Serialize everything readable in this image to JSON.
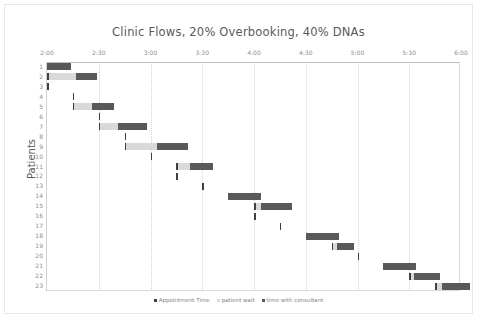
{
  "chart_data": {
    "type": "bar",
    "title": "Clinic Flows, 20% Overbooking, 40% DNAs",
    "xlabel": "",
    "ylabel": "Patients",
    "xlim": [
      "2:00",
      "6:00"
    ],
    "x_ticks": [
      "2:00",
      "2:30",
      "3:00",
      "3:30",
      "4:00",
      "4:30",
      "5:00",
      "5:30",
      "6:00"
    ],
    "x_tick_minutes": [
      0,
      30,
      60,
      90,
      120,
      150,
      180,
      210,
      240
    ],
    "axis_position": "top",
    "grid": true,
    "legend_position": "bottom",
    "orientation": "horizontal-gantt",
    "categories": [
      "1",
      "2",
      "3",
      "4",
      "5",
      "6",
      "7",
      "8",
      "9",
      "10",
      "11",
      "12",
      "13",
      "14",
      "15",
      "16",
      "17",
      "18",
      "19",
      "20",
      "21",
      "22",
      "23"
    ],
    "series": [
      {
        "name": "Appointment Time",
        "color": "#404040",
        "type": "marker"
      },
      {
        "name": "patient wait",
        "color": "#d9d9d9",
        "type": "duration"
      },
      {
        "name": "time with consultant",
        "color": "#595959",
        "type": "duration"
      }
    ],
    "units": "minutes after 2:00",
    "rows": [
      {
        "patient": "1",
        "appointment": 0,
        "wait": 0,
        "consult": 14
      },
      {
        "patient": "2",
        "appointment": 0,
        "wait": 17,
        "consult": 12
      },
      {
        "patient": "3",
        "appointment": 0,
        "wait": 0,
        "consult": 0
      },
      {
        "patient": "4",
        "appointment": 15,
        "wait": 0,
        "consult": 0
      },
      {
        "patient": "5",
        "appointment": 15,
        "wait": 11,
        "consult": 13
      },
      {
        "patient": "6",
        "appointment": 30,
        "wait": 0,
        "consult": 0
      },
      {
        "patient": "7",
        "appointment": 30,
        "wait": 11,
        "consult": 17
      },
      {
        "patient": "8",
        "appointment": 45,
        "wait": 0,
        "consult": 0
      },
      {
        "patient": "9",
        "appointment": 45,
        "wait": 19,
        "consult": 18
      },
      {
        "patient": "10",
        "appointment": 60,
        "wait": 0,
        "consult": 0
      },
      {
        "patient": "11",
        "appointment": 75,
        "wait": 8,
        "consult": 13
      },
      {
        "patient": "12",
        "appointment": 75,
        "wait": 0,
        "consult": 0
      },
      {
        "patient": "13",
        "appointment": 90,
        "wait": 0,
        "consult": 0
      },
      {
        "patient": "14",
        "appointment": 105,
        "wait": 0,
        "consult": 19
      },
      {
        "patient": "15",
        "appointment": 120,
        "wait": 4,
        "consult": 18
      },
      {
        "patient": "16",
        "appointment": 120,
        "wait": 0,
        "consult": 0
      },
      {
        "patient": "17",
        "appointment": 135,
        "wait": 0,
        "consult": 0
      },
      {
        "patient": "18",
        "appointment": 150,
        "wait": 0,
        "consult": 19
      },
      {
        "patient": "19",
        "appointment": 165,
        "wait": 3,
        "consult": 10
      },
      {
        "patient": "20",
        "appointment": 180,
        "wait": 0,
        "consult": 0
      },
      {
        "patient": "21",
        "appointment": 195,
        "wait": 0,
        "consult": 19
      },
      {
        "patient": "22",
        "appointment": 210,
        "wait": 3,
        "consult": 15
      },
      {
        "patient": "23",
        "appointment": 225,
        "wait": 4,
        "consult": 16
      }
    ]
  }
}
